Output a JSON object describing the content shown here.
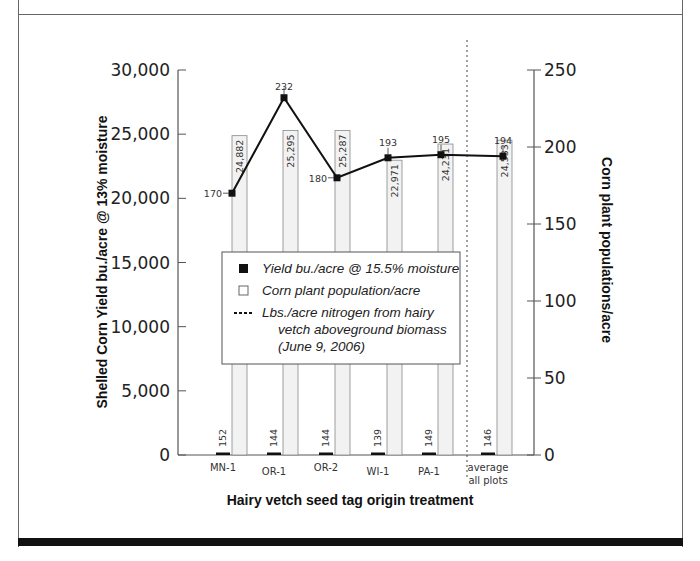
{
  "chart_data": {
    "type": "bar+line",
    "title": "",
    "xlabel": "Hairy vetch seed tag origin treatment",
    "ylabel_left": "Shelled Corn Yield bu./acre @ 13% moisture",
    "ylabel_right": "Corn plant populations/acre",
    "ylim_left": [
      0,
      30000
    ],
    "ylim_right": [
      0,
      250
    ],
    "left_ticks": [
      "0",
      "5,000",
      "10,000",
      "15,000",
      "20,000",
      "25,000",
      "30,000"
    ],
    "right_ticks": [
      "0",
      "50",
      "100",
      "150",
      "200",
      "250"
    ],
    "categories": [
      "MN-1",
      "OR-1",
      "OR-2",
      "WI-1",
      "PA-1",
      "average all plots"
    ],
    "category_lines": [
      [
        "MN-1"
      ],
      [
        "OR-1"
      ],
      [
        "OR-2"
      ],
      [
        "WI-1"
      ],
      [
        "PA-1"
      ],
      [
        "average",
        "all plots"
      ]
    ],
    "grid": false,
    "legend_position": "inside-center",
    "separator_before_category": "average all plots",
    "series": [
      {
        "name": "Yield bu./acre @ 15.5% moisture",
        "type": "bar",
        "axis": "left",
        "color": "#111111",
        "values": [
          152,
          144,
          144,
          139,
          149,
          146
        ],
        "labels": [
          "152",
          "144",
          "144",
          "139",
          "149",
          "146"
        ]
      },
      {
        "name": "Corn plant population/acre",
        "type": "bar",
        "axis": "left",
        "color": "#f2f2f2",
        "values": [
          24882,
          25295,
          25287,
          22971,
          24231,
          24533
        ],
        "labels": [
          "24,882",
          "25,295",
          "25,287",
          "22,971",
          "24,231",
          "24,533"
        ]
      },
      {
        "name": "Lbs./acre nitrogen from hairy vetch aboveground biomass (June 9, 2006)",
        "type": "line",
        "axis": "right",
        "color": "#111111",
        "values": [
          170,
          232,
          180,
          193,
          195,
          194
        ],
        "labels": [
          "170",
          "232",
          "180",
          "193",
          "195",
          "194"
        ]
      }
    ]
  },
  "legend": {
    "items": [
      {
        "lines": [
          "Yield bu./acre @ 15.5% moisture"
        ]
      },
      {
        "lines": [
          "Corn plant population/acre"
        ]
      },
      {
        "lines": [
          "Lbs./acre nitrogen from hairy",
          "vetch aboveground biomass",
          "(June 9, 2006)"
        ]
      }
    ]
  }
}
